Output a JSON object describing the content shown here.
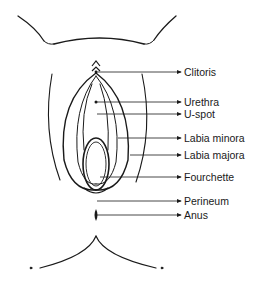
{
  "diagram": {
    "labels": [
      {
        "text": "Clitoris",
        "y": 66
      },
      {
        "text": "Urethra",
        "y": 96
      },
      {
        "text": "U-spot",
        "y": 108
      },
      {
        "text": "Labia minora",
        "y": 132
      },
      {
        "text": "Labia majora",
        "y": 149
      },
      {
        "text": "Fourchette",
        "y": 171
      },
      {
        "text": "Perineum",
        "y": 195
      },
      {
        "text": "Anus",
        "y": 209
      }
    ],
    "colors": {
      "line": "#1a1a1a",
      "text": "#1a1a1a",
      "background": "#ffffff"
    }
  }
}
